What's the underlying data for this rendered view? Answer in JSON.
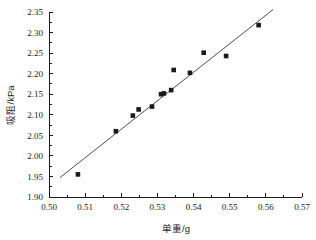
{
  "chart_data": {
    "type": "scatter",
    "title": "",
    "xlabel": "单重/g",
    "ylabel": "吸阻/kPa",
    "xlim": [
      0.5,
      0.57
    ],
    "ylim": [
      1.9,
      2.35
    ],
    "xticks": [
      "0.50",
      "0.51",
      "0.52",
      "0.53",
      "0.54",
      "0.55",
      "0.56",
      "0.57"
    ],
    "xtick_values": [
      0.5,
      0.51,
      0.52,
      0.53,
      0.54,
      0.55,
      0.56,
      0.57
    ],
    "yticks": [
      "1.90",
      "1.95",
      "2.00",
      "2.05",
      "2.10",
      "2.15",
      "2.20",
      "2.25",
      "2.30",
      "2.35"
    ],
    "ytick_values": [
      1.9,
      1.95,
      2.0,
      2.05,
      2.1,
      2.15,
      2.2,
      2.25,
      2.3,
      2.35
    ],
    "grid": false,
    "legend": null,
    "marker": "square",
    "marker_color": "#1a1a1a",
    "line_color": "#3a3a3a",
    "points": [
      {
        "x": 0.508,
        "y": 1.955
      },
      {
        "x": 0.5185,
        "y": 2.06
      },
      {
        "x": 0.5232,
        "y": 2.098
      },
      {
        "x": 0.5248,
        "y": 2.113
      },
      {
        "x": 0.5285,
        "y": 2.12
      },
      {
        "x": 0.531,
        "y": 2.15
      },
      {
        "x": 0.5318,
        "y": 2.152
      },
      {
        "x": 0.5338,
        "y": 2.16
      },
      {
        "x": 0.5345,
        "y": 2.209
      },
      {
        "x": 0.539,
        "y": 2.202
      },
      {
        "x": 0.5428,
        "y": 2.251
      },
      {
        "x": 0.549,
        "y": 2.243
      },
      {
        "x": 0.558,
        "y": 2.318
      }
    ],
    "fit_line": {
      "type": "linear",
      "x_start": 0.503,
      "y_start": 1.947,
      "x_end": 0.562,
      "y_end": 2.356
    }
  },
  "axes": {
    "x_axis_title": "单重/g",
    "y_axis_title": "吸阻/kPa"
  }
}
